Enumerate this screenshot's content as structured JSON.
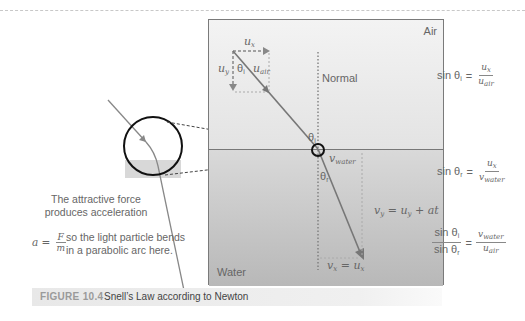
{
  "figure": {
    "number": "FIGURE 10.4",
    "caption": "Snell’s Law according to Newton"
  },
  "panel": {
    "air_label": "Air",
    "water_label": "Water",
    "normal_label": "Normal",
    "labels": {
      "ux": "u",
      "ux_sub": "x",
      "uy": "u",
      "uy_sub": "y",
      "theta_i": "θ",
      "theta_i_sub": "i",
      "uair": "u",
      "uair_sub": "air",
      "theta_i2": "θ",
      "theta_i2_sub": "i",
      "vwater": "v",
      "vwater_sub": "water",
      "theta_r": "θ",
      "theta_r_sub": "r",
      "vy_eq": "v",
      "vy_eq_sub": "y",
      "vy_eq_rest": " = u",
      "vy_eq_rest_sub": "y",
      "vy_eq_tail": " + at",
      "vx_eq": "v",
      "vx_eq_sub": "x",
      "vx_eq_rest": " = u",
      "vx_eq_rest_sub": "x"
    }
  },
  "annotation": {
    "line1": "The attractive force",
    "line2": "produces acceleration",
    "a_eq": "a =",
    "a_num": "F",
    "a_den": "m",
    "line3": "so the light particle bends",
    "line4": "in a parabolic arc here."
  },
  "equations": {
    "eq1": {
      "lhs": "sin θ",
      "lhs_sub": "i",
      "eq": "=",
      "num": "u",
      "num_sub": "x",
      "den": "u",
      "den_sub": "air"
    },
    "eq2": {
      "lhs": "sin θ",
      "lhs_sub": "r",
      "eq": "=",
      "num": "u",
      "num_sub": "x",
      "den": "v",
      "den_sub": "water"
    },
    "eq3": {
      "lnum": "sin θ",
      "lnum_sub": "i",
      "lden": "sin θ",
      "lden_sub": "r",
      "eq": "=",
      "num": "v",
      "num_sub": "water",
      "den": "u",
      "den_sub": "air"
    }
  }
}
